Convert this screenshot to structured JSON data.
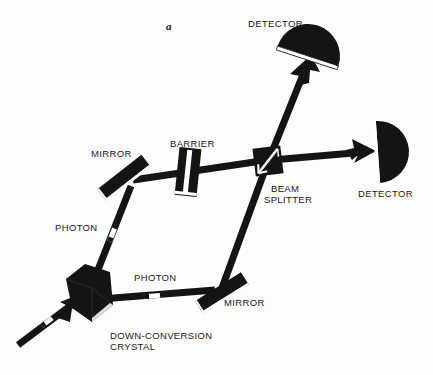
{
  "figure": {
    "panel_letter": "a",
    "background_color": "#fdfdfd",
    "ink_color": "#141414",
    "highlight_color": "#ffffff"
  },
  "labels": {
    "detector_top": "DETECTOR",
    "detector_right": "DETECTOR",
    "mirror_upper": "MIRROR",
    "mirror_lower": "MIRROR",
    "barrier": "BARRIER",
    "beam_splitter_line1": "BEAM",
    "beam_splitter_line2": "SPLITTER",
    "photon_upper": "PHOTON",
    "photon_lower": "PHOTON",
    "crystal_line1": "DOWN-CONVERSION",
    "crystal_line2": "CRYSTAL"
  },
  "components": [
    {
      "name": "down-conversion-crystal",
      "kind": "polygon-block"
    },
    {
      "name": "mirror-upper",
      "kind": "tilted-bar"
    },
    {
      "name": "mirror-lower",
      "kind": "tilted-bar"
    },
    {
      "name": "barrier",
      "kind": "slab-with-slit"
    },
    {
      "name": "beam-splitter",
      "kind": "square-with-diagonal"
    },
    {
      "name": "detector-top",
      "kind": "half-disc"
    },
    {
      "name": "detector-right",
      "kind": "half-disc"
    }
  ],
  "beams": [
    {
      "name": "pump-beam-in",
      "from": "bottom-left",
      "to": "down-conversion-crystal",
      "arrow": true,
      "photon_marker": true
    },
    {
      "name": "beam-crystal-to-upper-mirror",
      "from": "down-conversion-crystal",
      "to": "mirror-upper",
      "arrow": false,
      "photon_marker": true
    },
    {
      "name": "beam-upper-mirror-to-beam-splitter",
      "from": "mirror-upper",
      "to": "beam-splitter",
      "arrow": false,
      "photon_marker": false,
      "passes_through": "barrier"
    },
    {
      "name": "beam-crystal-to-lower-mirror",
      "from": "down-conversion-crystal",
      "to": "mirror-lower",
      "arrow": false,
      "photon_marker": true
    },
    {
      "name": "beam-lower-mirror-to-beam-splitter",
      "from": "mirror-lower",
      "to": "beam-splitter",
      "arrow": false,
      "photon_marker": false
    },
    {
      "name": "beam-splitter-to-top-detector",
      "from": "beam-splitter",
      "to": "detector-top",
      "arrow": true,
      "photon_marker": false
    },
    {
      "name": "beam-splitter-to-right-detector",
      "from": "beam-splitter",
      "to": "detector-right",
      "arrow": true,
      "photon_marker": false
    }
  ]
}
